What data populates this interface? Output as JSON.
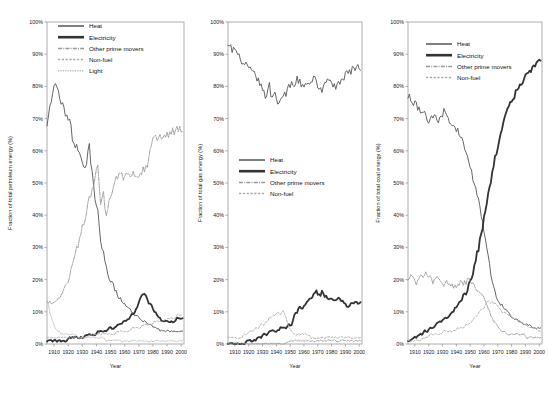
{
  "figure": {
    "panel_count": 3,
    "shared_xlabel": "Year",
    "xticks": [
      "1910",
      "1920",
      "1930",
      "1940",
      "1950",
      "1960",
      "1970",
      "1980",
      "1990",
      "2000"
    ],
    "yticks": [
      "0%",
      "10%",
      "20%",
      "30%",
      "40%",
      "50%",
      "60%",
      "70%",
      "80%",
      "90%",
      "100%"
    ],
    "colors": {
      "heat": "#555555",
      "electricity": "#333333",
      "other_prime_movers": "#999999",
      "non_fuel": "#aaaaaa",
      "light": "#bbbbbb",
      "axis": "#9a9a9a",
      "background": "#ffffff"
    }
  },
  "chart_data": [
    {
      "type": "line",
      "title": "",
      "xlabel": "Year",
      "ylabel": "Fraction of total petroleum energy (%)",
      "xlim": [
        1905,
        2002
      ],
      "ylim": [
        0,
        100
      ],
      "grid": false,
      "legend_position": "top-left",
      "x": [
        1905,
        1907,
        1909,
        1911,
        1913,
        1915,
        1917,
        1919,
        1921,
        1923,
        1925,
        1927,
        1929,
        1931,
        1933,
        1935,
        1937,
        1939,
        1941,
        1943,
        1945,
        1947,
        1949,
        1951,
        1953,
        1955,
        1957,
        1959,
        1961,
        1963,
        1965,
        1967,
        1969,
        1971,
        1973,
        1975,
        1977,
        1979,
        1981,
        1983,
        1985,
        1987,
        1989,
        1991,
        1993,
        1995,
        1997,
        1999,
        2001
      ],
      "series": [
        {
          "name": "Heat",
          "style": "solid",
          "values": [
            69,
            74,
            78,
            81,
            79,
            75,
            73,
            71,
            70,
            64,
            62,
            61,
            59,
            54,
            57,
            61,
            53,
            44,
            41,
            33,
            28,
            24,
            21,
            19,
            17,
            15,
            14,
            13,
            12,
            11,
            10,
            9,
            9,
            8,
            7,
            7,
            6,
            6,
            5,
            5,
            4,
            4,
            4,
            4,
            4,
            4,
            4,
            4,
            4
          ]
        },
        {
          "name": "Electricity",
          "style": "thick-solid",
          "values": [
            1,
            1,
            1,
            1,
            1,
            1,
            1,
            1,
            2,
            2,
            2,
            2,
            2,
            2,
            3,
            3,
            3,
            3,
            4,
            4,
            4,
            4,
            5,
            5,
            5,
            6,
            6,
            7,
            7,
            8,
            9,
            10,
            12,
            14,
            16,
            15,
            13,
            12,
            10,
            9,
            8,
            7,
            7,
            7,
            7,
            7,
            8,
            8,
            8
          ]
        },
        {
          "name": "Other prime movers",
          "style": "dashdot",
          "values": [
            13,
            13,
            13,
            13,
            14,
            15,
            17,
            19,
            21,
            25,
            28,
            31,
            35,
            38,
            41,
            45,
            48,
            52,
            56,
            44,
            47,
            39,
            44,
            47,
            51,
            52,
            53,
            52,
            53,
            52,
            53,
            53,
            52,
            53,
            54,
            55,
            57,
            62,
            64,
            64,
            64,
            65,
            65,
            65,
            66,
            66,
            67,
            67,
            66
          ]
        },
        {
          "name": "Non-fuel",
          "style": "dashed",
          "values": [
            2,
            2,
            2,
            2,
            2,
            2,
            2,
            2,
            2,
            2,
            2,
            2,
            2,
            2,
            2,
            3,
            3,
            3,
            3,
            3,
            3,
            3,
            3,
            3,
            3,
            4,
            4,
            4,
            4,
            4,
            5,
            5,
            5,
            5,
            6,
            6,
            6,
            6,
            7,
            7,
            7,
            7,
            8,
            8,
            8,
            8,
            9,
            9,
            9
          ]
        },
        {
          "name": "Light",
          "style": "dotted",
          "values": [
            14,
            10,
            7,
            5,
            4,
            3,
            3,
            3,
            3,
            3,
            3,
            2,
            2,
            2,
            2,
            2,
            2,
            2,
            2,
            2,
            2,
            1,
            1,
            1,
            1,
            1,
            1,
            1,
            1,
            1,
            1,
            1,
            1,
            1,
            1,
            1,
            1,
            1,
            1,
            1,
            1,
            1,
            1,
            1,
            1,
            1,
            1,
            1,
            1
          ]
        }
      ]
    },
    {
      "type": "line",
      "title": "",
      "xlabel": "Year",
      "ylabel": "Fraction of total gas energy (%)",
      "xlim": [
        1905,
        2002
      ],
      "ylim": [
        0,
        100
      ],
      "grid": false,
      "legend_position": "middle-left",
      "x": [
        1905,
        1907,
        1909,
        1911,
        1913,
        1915,
        1917,
        1919,
        1921,
        1923,
        1925,
        1927,
        1929,
        1931,
        1933,
        1935,
        1937,
        1939,
        1941,
        1943,
        1945,
        1947,
        1949,
        1951,
        1953,
        1955,
        1957,
        1959,
        1961,
        1963,
        1965,
        1967,
        1969,
        1971,
        1973,
        1975,
        1977,
        1979,
        1981,
        1983,
        1985,
        1987,
        1989,
        1991,
        1993,
        1995,
        1997,
        1999,
        2001
      ],
      "series": [
        {
          "name": "Heat",
          "style": "solid",
          "values": [
            93,
            92,
            91,
            90,
            89,
            88,
            87,
            86,
            85,
            84,
            83,
            82,
            80,
            78,
            77,
            80,
            76,
            77,
            74,
            75,
            77,
            78,
            80,
            81,
            81,
            82,
            81,
            80,
            80,
            81,
            82,
            83,
            81,
            80,
            79,
            81,
            82,
            82,
            81,
            80,
            81,
            82,
            83,
            84,
            84,
            85,
            85,
            86,
            85
          ]
        },
        {
          "name": "Electricity",
          "style": "thick-solid",
          "values": [
            0,
            0,
            0,
            0,
            0,
            0,
            0,
            1,
            1,
            1,
            1,
            2,
            2,
            3,
            3,
            4,
            4,
            4,
            4,
            5,
            5,
            5,
            6,
            6,
            9,
            10,
            12,
            11,
            12,
            13,
            14,
            15,
            16,
            15,
            16,
            15,
            14,
            14,
            14,
            14,
            14,
            13,
            13,
            12,
            12,
            13,
            13,
            13,
            13
          ]
        },
        {
          "name": "Other prime movers",
          "style": "dashdot",
          "values": [
            0,
            0,
            0,
            0,
            0,
            0,
            0,
            0,
            0,
            0,
            0,
            0,
            0,
            0,
            0,
            0,
            0,
            0,
            0,
            0,
            0,
            0,
            1,
            1,
            1,
            1,
            1,
            1,
            1,
            1,
            1,
            1,
            1,
            1,
            1,
            1,
            1,
            1,
            1,
            1,
            1,
            1,
            1,
            1,
            1,
            1,
            1,
            1,
            1
          ]
        },
        {
          "name": "Non-fuel",
          "style": "dashed",
          "values": [
            2,
            2,
            2,
            2,
            2,
            2,
            3,
            3,
            4,
            4,
            5,
            5,
            6,
            6,
            7,
            8,
            9,
            9,
            10,
            9,
            10,
            8,
            5,
            4,
            3,
            3,
            3,
            3,
            3,
            3,
            2,
            2,
            2,
            2,
            2,
            2,
            2,
            2,
            2,
            2,
            2,
            2,
            2,
            2,
            2,
            2,
            2,
            2,
            2
          ]
        }
      ]
    },
    {
      "type": "line",
      "title": "",
      "xlabel": "Year",
      "ylabel": "Fraction of total coal energy (%)",
      "xlim": [
        1905,
        2002
      ],
      "ylim": [
        0,
        100
      ],
      "grid": false,
      "legend_position": "top-center",
      "x": [
        1905,
        1907,
        1909,
        1911,
        1913,
        1915,
        1917,
        1919,
        1921,
        1923,
        1925,
        1927,
        1929,
        1931,
        1933,
        1935,
        1937,
        1939,
        1941,
        1943,
        1945,
        1947,
        1949,
        1951,
        1953,
        1955,
        1957,
        1959,
        1961,
        1963,
        1965,
        1967,
        1969,
        1971,
        1973,
        1975,
        1977,
        1979,
        1981,
        1983,
        1985,
        1987,
        1989,
        1991,
        1993,
        1995,
        1997,
        1999,
        2001
      ],
      "series": [
        {
          "name": "Heat",
          "style": "solid",
          "values": [
            77,
            76,
            75,
            74,
            73,
            71,
            72,
            70,
            69,
            71,
            70,
            69,
            71,
            72,
            70,
            69,
            68,
            67,
            66,
            64,
            62,
            60,
            57,
            54,
            50,
            47,
            43,
            38,
            33,
            27,
            22,
            18,
            15,
            13,
            12,
            11,
            10,
            9,
            8,
            8,
            7,
            7,
            6,
            6,
            6,
            5,
            5,
            5,
            5
          ]
        },
        {
          "name": "Electricity",
          "style": "thick-solid",
          "values": [
            1,
            1,
            2,
            2,
            3,
            3,
            4,
            4,
            5,
            5,
            6,
            7,
            7,
            8,
            8,
            9,
            10,
            11,
            12,
            13,
            15,
            16,
            18,
            21,
            24,
            28,
            32,
            36,
            41,
            46,
            51,
            56,
            60,
            64,
            67,
            70,
            72,
            74,
            76,
            78,
            80,
            81,
            82,
            83,
            84,
            85,
            86,
            87,
            88
          ]
        },
        {
          "name": "Other prime movers",
          "style": "dashdot",
          "values": [
            20,
            21,
            20,
            19,
            20,
            22,
            21,
            22,
            21,
            19,
            20,
            21,
            19,
            18,
            19,
            19,
            18,
            18,
            18,
            19,
            19,
            19,
            20,
            19,
            18,
            17,
            16,
            15,
            13,
            11,
            9,
            7,
            6,
            5,
            4,
            4,
            3,
            3,
            3,
            3,
            3,
            3,
            3,
            2,
            2,
            2,
            2,
            2,
            2
          ]
        },
        {
          "name": "Non-fuel",
          "style": "dashed",
          "values": [
            1,
            1,
            1,
            1,
            1,
            2,
            2,
            2,
            3,
            3,
            3,
            3,
            3,
            4,
            4,
            4,
            4,
            4,
            5,
            5,
            5,
            6,
            6,
            7,
            8,
            9,
            10,
            11,
            12,
            13,
            13,
            13,
            12,
            11,
            10,
            10,
            9,
            9,
            8,
            8,
            7,
            7,
            6,
            6,
            5,
            5,
            5,
            4,
            4
          ]
        }
      ]
    }
  ]
}
